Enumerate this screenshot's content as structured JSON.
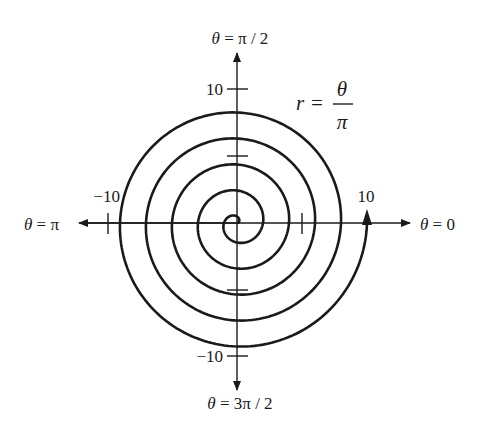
{
  "diagram": {
    "type": "polar-spiral",
    "equation": {
      "lhs": "r",
      "eq": "=",
      "numerator": "θ",
      "denominator": "π"
    },
    "axis_labels": {
      "top": {
        "theta": "θ",
        "rest": " = π / 2"
      },
      "bottom": {
        "theta": "θ",
        "rest": " = 3π / 2"
      },
      "left": {
        "theta": "θ",
        "rest": " = π"
      },
      "right": {
        "theta": "θ",
        "rest": " = 0"
      }
    },
    "tick_labels": {
      "top": "10",
      "bottom": "−10",
      "left": "−10",
      "right": "10"
    },
    "spiral": {
      "theta_start": 0,
      "theta_end_over_pi": 10,
      "r_max": 10,
      "minor_tick_value": 5
    },
    "colors": {
      "ink": "#1a1a1a",
      "background": "#ffffff"
    }
  }
}
